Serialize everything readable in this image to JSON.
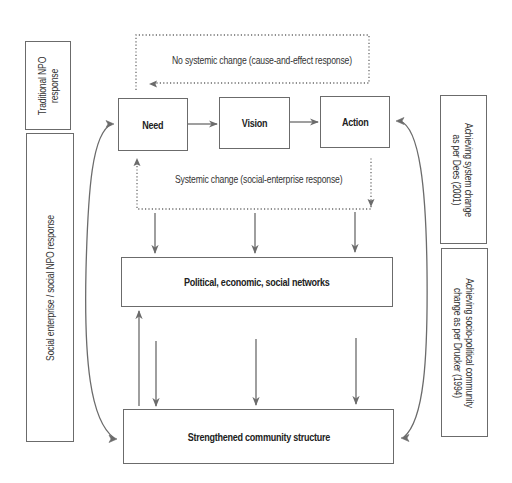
{
  "diagram": {
    "stroke_color": "#6b6b6b",
    "text_color": "#2a2a2a",
    "background": "#ffffff",
    "top_loop_caption": "No systemic change (cause-and-effect response)",
    "systemic_caption": "Systemic change (social-enterprise response)",
    "flow_boxes": {
      "need": "Need",
      "vision": "Vision",
      "action": "Action"
    },
    "networks_box": "Political, economic, social networks",
    "community_box": "Strengthened community structure",
    "left_labels": {
      "traditional": [
        "Traditional NPO",
        "response"
      ],
      "social": "Social enterprise / social NPO response"
    },
    "right_labels": {
      "dees": [
        "Achieving system change",
        "as per Dees (2001)"
      ],
      "drucker": [
        "Achieving socio-political community",
        "change as per Drucker (1994)"
      ]
    },
    "nodes": [
      {
        "id": "need",
        "label": "Need"
      },
      {
        "id": "vision",
        "label": "Vision"
      },
      {
        "id": "action",
        "label": "Action"
      },
      {
        "id": "networks",
        "label": "Political, economic, social networks"
      },
      {
        "id": "community",
        "label": "Strengthened community structure"
      }
    ],
    "edges": [
      {
        "from": "need",
        "to": "vision",
        "style": "solid"
      },
      {
        "from": "vision",
        "to": "action",
        "style": "solid"
      },
      {
        "from": "action",
        "to": "need",
        "style": "dotted",
        "label": "No systemic change (cause-and-effect response)"
      },
      {
        "from": "need",
        "to": "action",
        "style": "dotted",
        "label": "Systemic change (social-enterprise response)"
      },
      {
        "from": "systemic-change",
        "to": "networks",
        "style": "solid",
        "count": 3
      },
      {
        "from": "networks",
        "to": "community",
        "style": "solid",
        "count": 3
      },
      {
        "from": "community",
        "to": "networks",
        "style": "solid"
      },
      {
        "from": "community",
        "to": "need",
        "style": "curved"
      },
      {
        "from": "need",
        "to": "community",
        "style": "curved"
      },
      {
        "from": "community",
        "to": "action",
        "style": "curved"
      },
      {
        "from": "action",
        "to": "community",
        "style": "curved"
      }
    ]
  }
}
